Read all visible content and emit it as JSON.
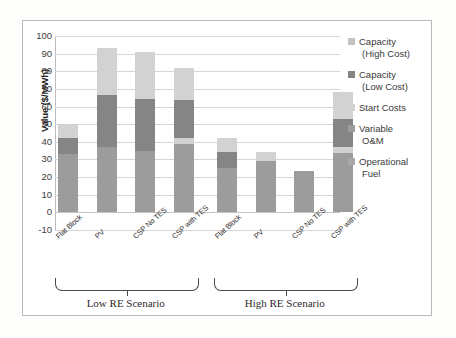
{
  "chart_data": {
    "type": "bar",
    "subtype": "stacked",
    "title": "",
    "xlabel": "",
    "ylabel": "Value ($/MWh)",
    "ylim": [
      -10,
      100
    ],
    "yticks": [
      100,
      90,
      80,
      70,
      60,
      50,
      40,
      30,
      20,
      10,
      0,
      -10
    ],
    "grid": true,
    "legend_position": "right",
    "categories": [
      "Flat Block",
      "PV",
      "CSP No TES",
      "CSP with TES",
      "Flat Block",
      "PV",
      "CSP No TES",
      "CSP with TES"
    ],
    "groups": [
      {
        "label": "Low RE Scenario",
        "categories": [
          "Flat Block",
          "PV",
          "CSP No TES",
          "CSP with TES"
        ]
      },
      {
        "label": "High RE Scenario",
        "categories": [
          "Flat Block",
          "PV",
          "CSP No TES",
          "CSP with TES"
        ]
      }
    ],
    "series": [
      {
        "name": "Operational Fuel",
        "color": "#a8a8a8",
        "values": [
          0,
          0,
          0,
          0,
          0,
          0,
          0,
          0
        ]
      },
      {
        "name": "Variable O&M",
        "color": "#9c9c9c",
        "values": [
          33,
          37,
          35,
          39,
          25,
          29,
          23.5,
          33.5
        ]
      },
      {
        "name": "Start Costs",
        "color": "#d2d2d2",
        "values": [
          8,
          26.5,
          26.5,
          21,
          7.5,
          5,
          0,
          19
        ]
      },
      {
        "name": "Capacity (Low Cost)",
        "color": "#858585",
        "values": [
          9,
          29.5,
          29.5,
          22,
          9.5,
          0,
          0,
          16
        ]
      },
      {
        "name": "Capacity (High Cost)",
        "color": "#c2c2c2",
        "values": [
          0,
          0,
          0,
          0,
          0,
          0,
          0,
          0
        ]
      }
    ],
    "bar_totals": [
      50,
      93,
      91,
      82,
      42,
      34,
      23.5,
      68.5
    ],
    "stacks": [
      {
        "category": "Flat Block",
        "group": "Low RE Scenario",
        "segments": [
          {
            "name": "Variable O&M",
            "from": 0,
            "to": 33
          },
          {
            "name": "Capacity (Low Cost)",
            "from": 33,
            "to": 42
          },
          {
            "name": "Start Costs",
            "from": 42,
            "to": 50
          }
        ]
      },
      {
        "category": "PV",
        "group": "Low RE Scenario",
        "segments": [
          {
            "name": "Variable O&M",
            "from": 0,
            "to": 37
          },
          {
            "name": "Capacity (Low Cost)",
            "from": 37,
            "to": 66.5
          },
          {
            "name": "Start Costs",
            "from": 66.5,
            "to": 93
          }
        ]
      },
      {
        "category": "CSP No TES",
        "group": "Low RE Scenario",
        "segments": [
          {
            "name": "Variable O&M",
            "from": 0,
            "to": 35
          },
          {
            "name": "Capacity (Low Cost)",
            "from": 35,
            "to": 64.5
          },
          {
            "name": "Start Costs",
            "from": 64.5,
            "to": 91
          }
        ]
      },
      {
        "category": "CSP with TES",
        "group": "Low RE Scenario",
        "segments": [
          {
            "name": "Variable O&M",
            "from": 0,
            "to": 39
          },
          {
            "name": "Start Costs",
            "from": 39,
            "to": 42
          },
          {
            "name": "Capacity (Low Cost)",
            "from": 42,
            "to": 64
          },
          {
            "name": "Start Costs",
            "from": 64,
            "to": 82
          }
        ]
      },
      {
        "category": "Flat Block",
        "group": "High RE Scenario",
        "segments": [
          {
            "name": "Variable O&M",
            "from": 0,
            "to": 25
          },
          {
            "name": "Capacity (Low Cost)",
            "from": 25,
            "to": 34.5
          },
          {
            "name": "Start Costs",
            "from": 34.5,
            "to": 42
          }
        ]
      },
      {
        "category": "PV",
        "group": "High RE Scenario",
        "segments": [
          {
            "name": "Variable O&M",
            "from": 0,
            "to": 29
          },
          {
            "name": "Start Costs",
            "from": 29,
            "to": 34
          }
        ]
      },
      {
        "category": "CSP No TES",
        "group": "High RE Scenario",
        "segments": [
          {
            "name": "Variable O&M",
            "from": 0,
            "to": 23.5
          }
        ]
      },
      {
        "category": "CSP with TES",
        "group": "High RE Scenario",
        "segments": [
          {
            "name": "Variable O&M",
            "from": 0,
            "to": 33.5
          },
          {
            "name": "Start Costs",
            "from": 33.5,
            "to": 37
          },
          {
            "name": "Capacity (Low Cost)",
            "from": 37,
            "to": 53
          },
          {
            "name": "Start Costs",
            "from": 53,
            "to": 68.5
          }
        ]
      }
    ]
  },
  "legend": {
    "items": [
      {
        "line1": "Capacity",
        "line2": "(High Cost)",
        "color": "#c2c2c2"
      },
      {
        "line1": "Capacity",
        "line2": "(Low Cost)",
        "color": "#858585"
      },
      {
        "line1": "Start Costs",
        "line2": "",
        "color": "#d2d2d2"
      },
      {
        "line1": "Variable",
        "line2": "O&M",
        "color": "#9c9c9c"
      },
      {
        "line1": "Operational",
        "line2": "Fuel",
        "color": "#a8a8a8"
      }
    ]
  },
  "colors": {
    "capacity_high": "#c2c2c2",
    "capacity_low": "#858585",
    "start_costs": "#d2d2d2",
    "variable_om": "#9c9c9c",
    "operational_fuel": "#a8a8a8",
    "grid": "#d6d6d6",
    "frame": "#b9b9b9",
    "text": "#3a3a3a"
  }
}
